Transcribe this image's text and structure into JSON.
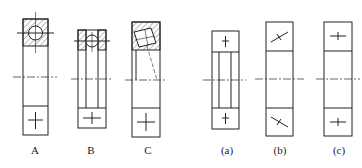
{
  "figures": {
    "left_group": [
      {
        "label": "A",
        "type": "angular-contact-ball-bearing-section"
      },
      {
        "label": "B",
        "type": "deep-groove-ball-bearing-section"
      },
      {
        "label": "C",
        "type": "tapered-roller-bearing-section"
      }
    ],
    "right_group": [
      {
        "label": "(a)",
        "type": "simplified-symbol-upright-cross"
      },
      {
        "label": "(b)",
        "type": "simplified-symbol-inclined-cross"
      },
      {
        "label": "(c)",
        "type": "simplified-symbol-horizontal-cross"
      }
    ]
  },
  "colors": {
    "line": "#222222",
    "background": "#ffffff"
  }
}
